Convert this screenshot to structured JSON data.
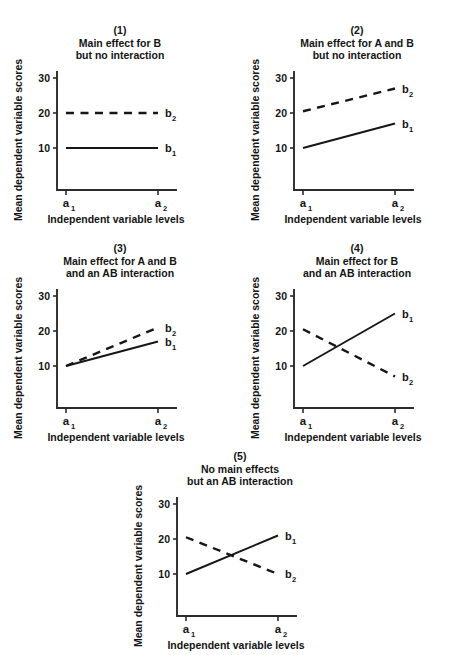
{
  "figure": {
    "axis_label_y": "Mean dependent variable scores",
    "axis_label_x": "Independent variable levels",
    "y_ticks": [
      "30",
      "20",
      "10"
    ],
    "x_ticks": [
      "a",
      "a"
    ],
    "x_tick_subs": [
      "1",
      "2"
    ],
    "series_labels": [
      "b",
      "b"
    ],
    "series_subs": [
      "1",
      "2"
    ],
    "line_color": "#161616",
    "axis_color": "#2b2b2b"
  },
  "chart_data": [
    {
      "type": "line",
      "panel_number": "(1)",
      "title_line1": "Main effect for B",
      "title_line2": "but no interaction",
      "xlabel": "Independent variable levels",
      "ylabel": "Mean dependent variable scores",
      "categories": [
        "a1",
        "a2"
      ],
      "yticks": [
        10,
        20,
        30
      ],
      "ylim": [
        0,
        30
      ],
      "grid": false,
      "series": [
        {
          "name": "b1",
          "style": "solid",
          "values": [
            10,
            10
          ]
        },
        {
          "name": "b2",
          "style": "dashed",
          "values": [
            20,
            20
          ]
        }
      ]
    },
    {
      "type": "line",
      "panel_number": "(2)",
      "title_line1": "Main effect for A and B",
      "title_line2": "but no interaction",
      "xlabel": "Independent variable levels",
      "ylabel": "Mean dependent variable scores",
      "categories": [
        "a1",
        "a2"
      ],
      "yticks": [
        10,
        20,
        30
      ],
      "ylim": [
        0,
        30
      ],
      "grid": false,
      "series": [
        {
          "name": "b1",
          "style": "solid",
          "values": [
            10,
            17
          ]
        },
        {
          "name": "b2",
          "style": "dashed",
          "values": [
            20.5,
            27
          ]
        }
      ]
    },
    {
      "type": "line",
      "panel_number": "(3)",
      "title_line1": "Main effect for A and B",
      "title_line2": "and an AB interaction",
      "xlabel": "Independent variable levels",
      "ylabel": "Mean dependent variable scores",
      "categories": [
        "a1",
        "a2"
      ],
      "yticks": [
        10,
        20,
        30
      ],
      "ylim": [
        0,
        30
      ],
      "grid": false,
      "series": [
        {
          "name": "b1",
          "style": "solid",
          "values": [
            10,
            17
          ]
        },
        {
          "name": "b2",
          "style": "dashed",
          "values": [
            10,
            21
          ]
        }
      ]
    },
    {
      "type": "line",
      "panel_number": "(4)",
      "title_line1": "Main effect for B",
      "title_line2": "and an AB interaction",
      "xlabel": "Independent variable levels",
      "ylabel": "Mean dependent variable scores",
      "categories": [
        "a1",
        "a2"
      ],
      "yticks": [
        10,
        20,
        30
      ],
      "ylim": [
        0,
        30
      ],
      "grid": false,
      "series": [
        {
          "name": "b1",
          "style": "solid",
          "values": [
            10,
            25
          ]
        },
        {
          "name": "b2",
          "style": "dashed",
          "values": [
            20.5,
            7
          ]
        }
      ]
    },
    {
      "type": "line",
      "panel_number": "(5)",
      "title_line1": "No main effects",
      "title_line2": "but an AB interaction",
      "xlabel": "Independent variable levels",
      "ylabel": "Mean dependent variable scores",
      "categories": [
        "a1",
        "a2"
      ],
      "yticks": [
        10,
        20,
        30
      ],
      "ylim": [
        0,
        30
      ],
      "grid": false,
      "series": [
        {
          "name": "b1",
          "style": "solid",
          "values": [
            10,
            21
          ]
        },
        {
          "name": "b2",
          "style": "dashed",
          "values": [
            20.5,
            10
          ]
        }
      ]
    }
  ]
}
